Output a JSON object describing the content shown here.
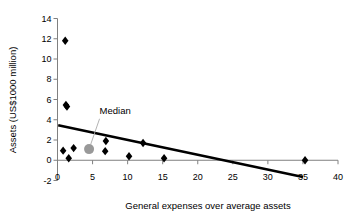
{
  "chart_data": {
    "type": "scatter",
    "title": "",
    "xlabel": "General expenses over average assets",
    "ylabel": "Assets (US$1000 million)",
    "xlim": [
      0,
      40
    ],
    "ylim": [
      -2,
      14
    ],
    "xticks": [
      "0",
      "5",
      "10",
      "15",
      "20",
      "25",
      "30",
      "35",
      "40"
    ],
    "yticks": [
      "-2",
      "0",
      "2",
      "4",
      "6",
      "8",
      "10",
      "12",
      "14"
    ],
    "xtick_values": [
      0,
      5,
      10,
      15,
      20,
      25,
      30,
      35,
      40
    ],
    "ytick_values": [
      -2,
      0,
      2,
      4,
      6,
      8,
      10,
      12,
      14
    ],
    "grid": false,
    "legend": false,
    "series": [
      {
        "name": "Banks",
        "marker": "diamond",
        "color": "#000000",
        "points": [
          {
            "x": 1.1,
            "y": 11.8
          },
          {
            "x": 1.2,
            "y": 5.45
          },
          {
            "x": 1.35,
            "y": 5.3
          },
          {
            "x": 0.8,
            "y": 0.95
          },
          {
            "x": 1.6,
            "y": 0.2
          },
          {
            "x": 2.3,
            "y": 1.2
          },
          {
            "x": 6.9,
            "y": 1.9
          },
          {
            "x": 6.8,
            "y": 0.9
          },
          {
            "x": 10.2,
            "y": 0.4
          },
          {
            "x": 12.2,
            "y": 1.7
          },
          {
            "x": 15.2,
            "y": 0.2
          },
          {
            "x": 35.3,
            "y": 0.0
          }
        ]
      },
      {
        "name": "Median",
        "marker": "circle",
        "color": "#999999",
        "points": [
          {
            "x": 4.5,
            "y": 1.1
          }
        ]
      }
    ],
    "trendline": {
      "name": "linear-fit",
      "color": "#000000",
      "x0": 0.1,
      "y0": 3.45,
      "x1": 35.0,
      "y1": -1.65
    },
    "annotations": [
      {
        "name": "median-callout",
        "text": "Median",
        "text_x": 6.0,
        "text_y": 4.6,
        "leader_from_x": 6.0,
        "leader_from_y": 4.1,
        "leader_to_x": 4.7,
        "leader_to_y": 1.5
      }
    ]
  },
  "axis": {
    "x_title": "General expenses over average assets",
    "y_title": "Assets (US$1000 million)"
  }
}
